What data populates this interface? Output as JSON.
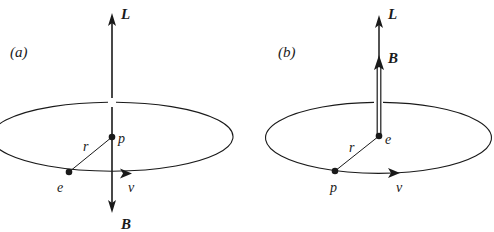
{
  "figure": {
    "panels": [
      {
        "id": "a",
        "panel_label": "(a)",
        "labels": {
          "angular_momentum": "L",
          "magnetic_field": "B",
          "center_particle": "p",
          "orbiting_particle": "e",
          "radius": "r",
          "velocity": "v"
        },
        "description": "Electron e orbits proton p; L points up, B points down"
      },
      {
        "id": "b",
        "panel_label": "(b)",
        "labels": {
          "angular_momentum": "L",
          "magnetic_field": "B",
          "center_particle": "e",
          "orbiting_particle": "p",
          "radius": "r",
          "velocity": "v"
        },
        "description": "Proton p orbits electron e; L and B both point up"
      }
    ],
    "colors": {
      "ink": "#1a1a1a",
      "background": "#ffffff"
    }
  }
}
